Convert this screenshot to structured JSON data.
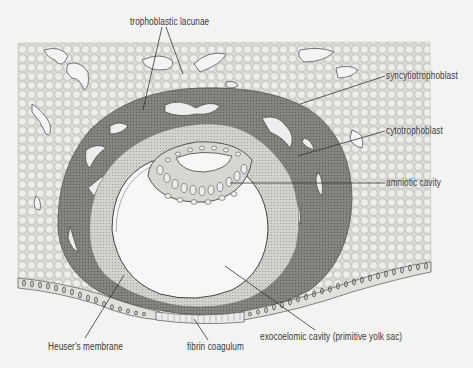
{
  "diagram": {
    "type": "anatomical-illustration",
    "colors": {
      "background": "#f3f3f1",
      "endometrium_stroma": "#d9d9d6",
      "syncytiotrophoblast": "#7d7d7a",
      "cytotrophoblast": "#c9c9c6",
      "cavity": "#f7f7f5",
      "lines": "#3a3a3a"
    },
    "labels": {
      "trophoblastic_lacunae": "trophoblastic lacunae",
      "syncytiotrophoblast": "syncytiotrophoblast",
      "cytotrophoblast": "cytotrophoblast",
      "amniotic_cavity": "amniotic cavity",
      "heusers_membrane": "Heuser's membrane",
      "fibrin_coagulum": "fibrin coagulum",
      "exocoelomic_cavity": "exocoelomic cavity (primitive yolk sac)"
    }
  }
}
